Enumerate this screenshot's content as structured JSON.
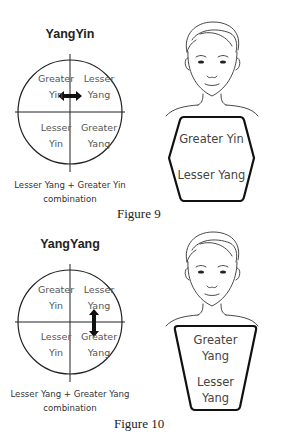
{
  "figures": [
    {
      "label": "Figure 9",
      "title": "YangYin",
      "quadrants": {
        "top_left": [
          "Greater",
          "Yin"
        ],
        "top_right": [
          "Lesser",
          "Yang"
        ],
        "bottom_left": [
          "Lesser",
          "Yin"
        ],
        "bottom_right": [
          "Greater",
          "Yang"
        ]
      },
      "arrow": "horizontal double arrow between Greater Yin and Lesser Yang",
      "caption": [
        "Lesser Yang + Greater Yin",
        "combination"
      ],
      "body_shape": "hexagon",
      "body_text": [
        "Greater Yin",
        "Lesser Yang"
      ]
    },
    {
      "label": "Figure 10",
      "title": "YangYang",
      "quadrants": {
        "top_left": [
          "Greater",
          "Yin"
        ],
        "top_right": [
          "Lesser",
          "Yang"
        ],
        "bottom_left": [
          "Lesser",
          "Yin"
        ],
        "bottom_right": [
          "Greater",
          "Yang"
        ]
      },
      "arrow": "vertical double arrow between Lesser Yang and Greater Yang",
      "caption": [
        "Lesser Yang + Greater Yang",
        "combination"
      ],
      "body_shape": "inverted trapezoid",
      "body_text": [
        "Greater",
        "Yang",
        "Lesser",
        "Yang"
      ]
    }
  ],
  "colors": {
    "line": "#222222",
    "text": "#555555",
    "background": "#ffffff"
  }
}
